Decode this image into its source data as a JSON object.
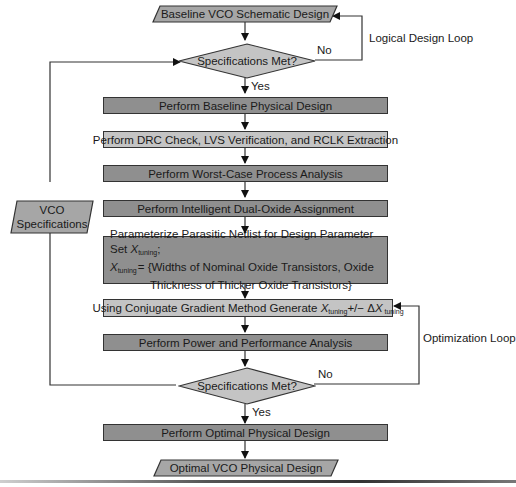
{
  "diagram": {
    "type": "flowchart",
    "nodes": {
      "start": {
        "label": "Baseline VCO Schematic Design",
        "shape": "parallelogram"
      },
      "decision1": {
        "label": "Specifications Met?",
        "shape": "diamond"
      },
      "step1": {
        "label": "Perform Baseline Physical Design"
      },
      "step2": {
        "label": "Perform DRC Check, LVS Verification, and RCLK Extraction"
      },
      "step3": {
        "label": "Perform Worst-Case Process Analysis"
      },
      "step4": {
        "label": "Perform Intelligent Dual-Oxide Assignment"
      },
      "step5": {
        "line1_prefix": "Parameterize Parasitic Netlist for Design Parameter Set ",
        "var": "X",
        "sub": "tuning",
        "line1_suffix": ";",
        "line2_suffix": "= {Widths of Nominal Oxide Transistors, Oxide",
        "line3": "Thickness of Thicker Oxide Transistors}"
      },
      "step6": {
        "prefix": "Using Conjugate Gradient Method Generate ",
        "var": "X",
        "sub": "tuning",
        "middle": "+/− Δ",
        "var2": "X",
        "sub2": " tuning"
      },
      "step7": {
        "label": "Perform Power and Performance Analysis"
      },
      "decision2": {
        "label": "Specifications Met?",
        "shape": "diamond"
      },
      "step8": {
        "label": "Perform Optimal Physical Design"
      },
      "end": {
        "label": "Optimal VCO Physical Design",
        "shape": "parallelogram"
      },
      "specs": {
        "line1": "VCO",
        "line2": "Specifications",
        "shape": "parallelogram"
      }
    },
    "edge_labels": {
      "no1": "No",
      "yes1": "Yes",
      "no2": "No",
      "yes2": "Yes"
    },
    "loops": {
      "logical": "Logical Design Loop",
      "optimization": "Optimization Loop"
    },
    "colors": {
      "dark_fill": "#8f8f8f",
      "light_fill": "#c4c4c4",
      "stroke": "#333333",
      "arrow": "#111111"
    }
  }
}
